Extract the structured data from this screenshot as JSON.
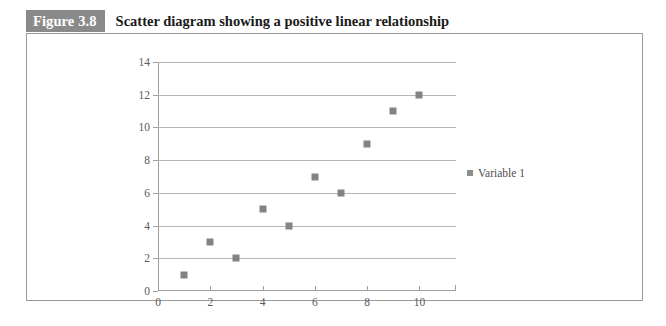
{
  "figure": {
    "number_label": "Figure 3.8",
    "caption": "Scatter diagram showing a positive linear relationship"
  },
  "colors": {
    "figure_number_bg": "#8a8a8a",
    "figure_number_text": "#ffffff",
    "panel_border": "#9a9a9a",
    "gridline": "#b6b6b6",
    "axis": "#9e9e9e",
    "marker": "#838383",
    "tick_label": "#5b5b5b"
  },
  "chart_data": {
    "type": "scatter",
    "title": "Scatter diagram showing a positive linear relationship",
    "xlabel": "",
    "ylabel": "",
    "xlim": [
      0,
      11.4
    ],
    "ylim": [
      0,
      14
    ],
    "xticks": [
      0,
      2,
      4,
      6,
      8,
      10
    ],
    "yticks": [
      0,
      2,
      4,
      6,
      8,
      10,
      12,
      14
    ],
    "grid": "horizontal",
    "legend_position": "right",
    "series": [
      {
        "name": "Variable 1",
        "marker": "square",
        "color": "#838383",
        "points": [
          {
            "x": 1,
            "y": 1
          },
          {
            "x": 2,
            "y": 3
          },
          {
            "x": 3,
            "y": 2
          },
          {
            "x": 4,
            "y": 5
          },
          {
            "x": 5,
            "y": 4
          },
          {
            "x": 6,
            "y": 7
          },
          {
            "x": 7,
            "y": 6
          },
          {
            "x": 8,
            "y": 9
          },
          {
            "x": 9,
            "y": 11
          },
          {
            "x": 10,
            "y": 12
          }
        ]
      }
    ]
  },
  "legend": {
    "entries": [
      {
        "label": "Variable 1",
        "marker_icon": "square-marker-icon"
      }
    ]
  }
}
